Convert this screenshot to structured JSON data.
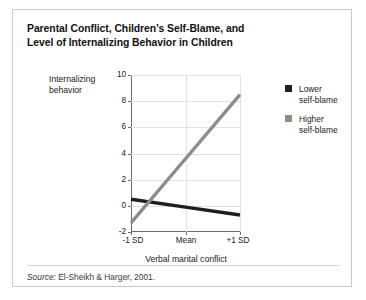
{
  "figure": {
    "title_line1": "Parental Conflict, Children's Self-Blame, and",
    "title_line2": "Level of Internalizing Behavior in Children",
    "source_keyword": "Source:",
    "source_text": " El-Sheikh & Harger, 2001."
  },
  "legend": {
    "entries": [
      {
        "label_line1": "Lower",
        "label_line2": "self-blame",
        "color": "#1f1f1f"
      },
      {
        "label_line1": "Higher",
        "label_line2": "self-blame",
        "color": "#8c8c8c"
      }
    ]
  },
  "axes": {
    "ylabel_line1": "Internalizing",
    "ylabel_line2": "behavior",
    "xlabel": "Verbal marital conflict",
    "yticks": [
      "10",
      "8",
      "6",
      "4",
      "2",
      "0",
      "-2"
    ],
    "xticks": [
      "-1 SD",
      "Mean",
      "+1 SD"
    ]
  },
  "chart_data": {
    "type": "line",
    "title": "Parental Conflict, Children's Self-Blame, and Level of Internalizing Behavior in Children",
    "xlabel": "Verbal marital conflict",
    "ylabel": "Internalizing behavior",
    "categories": [
      "-1 SD",
      "Mean",
      "+1 SD"
    ],
    "series": [
      {
        "name": "Lower self-blame",
        "color": "#1f1f1f",
        "values": [
          0.5,
          -0.1,
          -0.7
        ]
      },
      {
        "name": "Higher self-blame",
        "color": "#8c8c8c",
        "values": [
          -1.3,
          3.6,
          8.5
        ]
      }
    ],
    "ylim": [
      -2,
      10
    ],
    "ytick_values": [
      -2,
      0,
      2,
      4,
      6,
      8,
      10
    ],
    "grid": true,
    "legend_position": "right",
    "source": "El-Sheikh & Harger, 2001."
  }
}
